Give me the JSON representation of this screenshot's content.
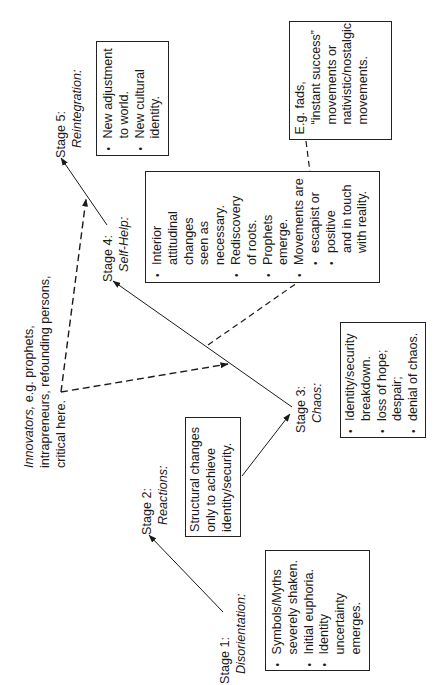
{
  "diagram": {
    "orientation": "rotated 90 degrees counter-clockwise",
    "stages": [
      {
        "id": "stage1",
        "label": "Stage 1:",
        "name": "Disorientation:",
        "box": [
          {
            "bullet": true,
            "lines": [
              "Symbols/Myths",
              "severely shaken."
            ]
          },
          {
            "bullet": true,
            "lines": [
              "Initial euphoria."
            ]
          },
          {
            "bullet": true,
            "lines": [
              "Identity",
              "uncertainty",
              "emerges."
            ]
          }
        ]
      },
      {
        "id": "stage2",
        "label": "Stage 2:",
        "name": "Reactions:",
        "box": [
          {
            "bullet": false,
            "lines": [
              "Structural changes",
              "only to achieve",
              "identity/security."
            ]
          }
        ]
      },
      {
        "id": "stage3",
        "label": "Stage 3:",
        "name": "Chaos:",
        "box": [
          {
            "bullet": true,
            "lines": [
              "Identity/security",
              "breakdown."
            ]
          },
          {
            "bullet": true,
            "lines": [
              "loss of hope;",
              "despair;"
            ]
          },
          {
            "bullet": true,
            "lines": [
              "denial of chaos."
            ]
          }
        ]
      },
      {
        "id": "stage4",
        "label": "Stage 4:",
        "name": "Self-Help:",
        "box": [
          {
            "bullet": true,
            "lines": [
              "Interior",
              "attitudinal",
              "changes",
              "seen as",
              "necessary."
            ]
          },
          {
            "bullet": true,
            "lines": [
              "Rediscovery",
              "of roots."
            ]
          },
          {
            "bullet": true,
            "lines": [
              "Prophets",
              "emerge."
            ]
          },
          {
            "bullet": true,
            "lines": [
              "Movements are"
            ]
          },
          {
            "bullet": true,
            "sub": true,
            "lines": [
              "escapist or"
            ]
          },
          {
            "bullet": true,
            "sub": true,
            "lines": [
              "positive",
              "and in touch",
              "with reality."
            ]
          }
        ]
      },
      {
        "id": "stage5",
        "label": "Stage 5:",
        "name": "Reintegration:",
        "box": [
          {
            "bullet": true,
            "lines": [
              "New adjustment",
              "to world."
            ]
          },
          {
            "bullet": true,
            "lines": [
              "New cultural",
              "identity."
            ]
          }
        ]
      }
    ],
    "innovators_note": {
      "italic_word": "Innovators,",
      "line1_rest": " e.g. prophets,",
      "line2": "intrapreneurs, refounding persons,",
      "line3": "critical here."
    },
    "escapist_note": {
      "lines": [
        "E.g. fads,",
        "“instant success”",
        "movements or",
        "nativistic/nostalgic",
        "movements."
      ]
    },
    "colors": {
      "ink": "#1a1a1a",
      "background": "#ffffff",
      "border": "#222222"
    }
  }
}
